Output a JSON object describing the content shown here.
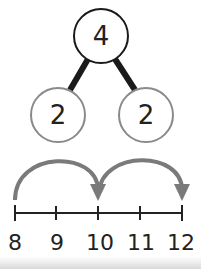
{
  "number_bond": {
    "whole": "4",
    "parts": [
      "2",
      "2"
    ],
    "whole_stroke_color": "#1a1a1a",
    "part_stroke_color": "#8a8a8a",
    "connector_color": "#1a1a1a"
  },
  "number_line": {
    "ticks": [
      "8",
      "9",
      "10",
      "11",
      "12"
    ],
    "jumps": [
      {
        "from": "8",
        "to": "10"
      },
      {
        "from": "10",
        "to": "12"
      }
    ],
    "line_color": "#222222",
    "arrow_color": "#7a7a7a"
  }
}
